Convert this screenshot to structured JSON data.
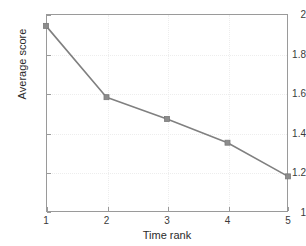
{
  "chart_data": {
    "type": "line",
    "title": "",
    "xlabel": "Time rank",
    "ylabel": "Average score",
    "x": [
      1,
      2,
      3,
      4,
      5
    ],
    "values": [
      1.94,
      1.58,
      1.47,
      1.35,
      1.18
    ],
    "series": [
      {
        "name": "Average score",
        "values": [
          1.94,
          1.58,
          1.47,
          1.35,
          1.18
        ]
      }
    ],
    "xlim": [
      1,
      5
    ],
    "ylim": [
      1,
      2
    ],
    "xticks": [
      1,
      2,
      3,
      4,
      5
    ],
    "yticks": [
      1,
      1.2,
      1.4,
      1.6,
      1.8,
      2
    ],
    "xtick_labels": [
      "1",
      "2",
      "3",
      "4",
      "5"
    ],
    "ytick_labels": [
      "1",
      "1.2",
      "1.4",
      "1.6",
      "1.8",
      "2"
    ],
    "grid": true,
    "legend": null,
    "marker": "square",
    "line_color": "#808080",
    "marker_color": "#8c8c8c",
    "grid_color": "#ededed",
    "axis_color": "#9a9a9a"
  }
}
